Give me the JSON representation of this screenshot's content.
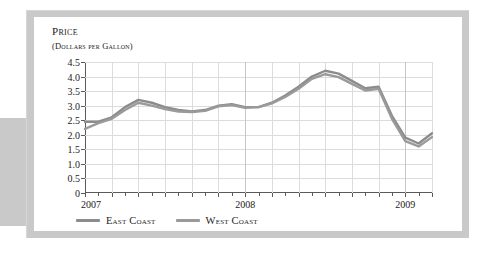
{
  "figure": {
    "axis_title_line1": "Price",
    "axis_title_line2": "(Dollars per Gallon)"
  },
  "legend": {
    "items": [
      {
        "label": "East Coast",
        "color": "#8c8c8c"
      },
      {
        "label": "West Coast",
        "color": "#9a9a9a"
      }
    ]
  },
  "colors": {
    "east_coast": "#8c8c8c",
    "west_coast": "#9a9a9a",
    "axis": "#5a5a5a",
    "grid": "#dcdcdc",
    "grid_major": "#c6c6c6",
    "card_frame": "#c9c9c9",
    "panel": "#ffffff",
    "text": "#1c1c1c"
  },
  "chart_data": {
    "type": "line",
    "title": "Price",
    "subtitle": "(Dollars per Gallon)",
    "xlabel": "",
    "ylabel": "Price (Dollars per Gallon)",
    "ylim": [
      0,
      4.5
    ],
    "yticks": [
      0,
      0.5,
      1.0,
      1.5,
      2.0,
      2.5,
      3.0,
      3.5,
      4.0,
      4.5
    ],
    "ytick_labels": [
      "0",
      "0.5",
      "1.0",
      "1.5",
      "2.0",
      "2.5",
      "3.0",
      "3.5",
      "4.0",
      "4.5"
    ],
    "xlim": [
      0,
      26
    ],
    "xtick_positions": [
      0,
      2,
      4,
      6,
      8,
      10,
      12,
      14,
      16,
      18,
      20,
      22,
      24,
      26
    ],
    "xtick_labels": [
      "2007",
      "",
      "",
      "",
      "",
      "",
      "2008",
      "",
      "",
      "",
      "",
      "",
      "2009",
      ""
    ],
    "x_axis_year_labels": [
      {
        "label": "2007",
        "x": 0
      },
      {
        "label": "2008",
        "x": 12
      },
      {
        "label": "2009",
        "x": 24
      }
    ],
    "grid": true,
    "legend_position": "below",
    "x": [
      0,
      1,
      2,
      3,
      4,
      5,
      6,
      7,
      8,
      9,
      10,
      11,
      12,
      13,
      14,
      15,
      16,
      17,
      18,
      19,
      20,
      21,
      22,
      23,
      24,
      25,
      26
    ],
    "series": [
      {
        "name": "East Coast",
        "color": "#8c8c8c",
        "values": [
          2.45,
          2.45,
          2.6,
          2.95,
          3.2,
          3.1,
          2.95,
          2.85,
          2.8,
          2.85,
          3.0,
          3.05,
          2.95,
          2.95,
          3.1,
          3.35,
          3.65,
          4.0,
          4.2,
          4.1,
          3.85,
          3.6,
          3.65,
          2.65,
          1.9,
          1.7,
          2.05
        ]
      },
      {
        "name": "West Coast",
        "color": "#9a9a9a",
        "values": [
          2.2,
          2.4,
          2.55,
          2.85,
          3.1,
          3.0,
          2.88,
          2.8,
          2.78,
          2.82,
          2.98,
          3.02,
          2.93,
          2.95,
          3.08,
          3.3,
          3.58,
          3.92,
          4.08,
          3.98,
          3.75,
          3.52,
          3.58,
          2.55,
          1.78,
          1.6,
          1.92
        ]
      }
    ]
  }
}
